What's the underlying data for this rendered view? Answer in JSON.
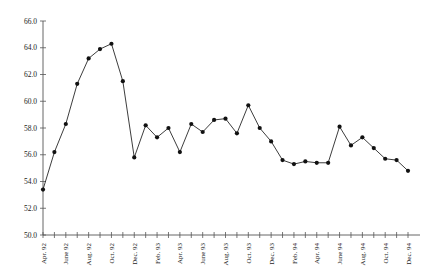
{
  "chart_data": {
    "type": "line",
    "title": "",
    "subtitle": "",
    "xlabel": "",
    "ylabel": "",
    "ylim": [
      50.0,
      66.0
    ],
    "ytick_step": 2.0,
    "yticks": [
      "50.0",
      "52.0",
      "54.0",
      "56.0",
      "58.0",
      "60.0",
      "62.0",
      "64.0",
      "66.0"
    ],
    "grid": false,
    "legend": "none",
    "marker": "filled-circle",
    "line_color": "#1a1a1a",
    "marker_color": "#111111",
    "axis_color": "#555555",
    "background": "#ffffff",
    "x": [
      "Apr. 92",
      "May 92",
      "June 92",
      "July 92",
      "Aug. 92",
      "Sept. 92",
      "Oct. 92",
      "Nov. 92",
      "Dec. 92",
      "Jan. 93",
      "Feb. 93",
      "Mar. 93",
      "Apr. 93",
      "May 93",
      "June 93",
      "July 93",
      "Aug. 93",
      "Sept. 93",
      "Oct. 93",
      "Nov. 93",
      "Dec. 93",
      "Jan. 94",
      "Feb. 94",
      "Mar. 94",
      "Apr. 94",
      "May 94",
      "June 94",
      "July 94",
      "Aug. 94",
      "Sept. 94",
      "Oct. 94",
      "Nov. 94",
      "Dec. 94"
    ],
    "xtick_labels_shown": [
      "Apr. 92",
      "June 92",
      "Aug. 92",
      "Oct. 92",
      "Dec. 92",
      "Feb. 93",
      "Apr. 93",
      "June 93",
      "Aug. 93",
      "Oct. 93",
      "Dec. 93",
      "Feb. 94",
      "Apr. 94",
      "June 94",
      "Aug. 94",
      "Oct. 94",
      "Dec. 94"
    ],
    "xtick_label_interval": 2,
    "values": [
      53.4,
      56.2,
      58.3,
      61.3,
      63.2,
      63.9,
      64.3,
      61.5,
      55.8,
      58.2,
      57.3,
      58.0,
      56.2,
      58.3,
      57.7,
      58.6,
      58.7,
      57.6,
      59.7,
      58.0,
      57.0,
      55.6,
      55.3,
      55.5,
      55.4,
      55.4,
      58.1,
      56.7,
      57.3,
      56.5,
      55.7,
      55.6,
      54.8
    ]
  }
}
